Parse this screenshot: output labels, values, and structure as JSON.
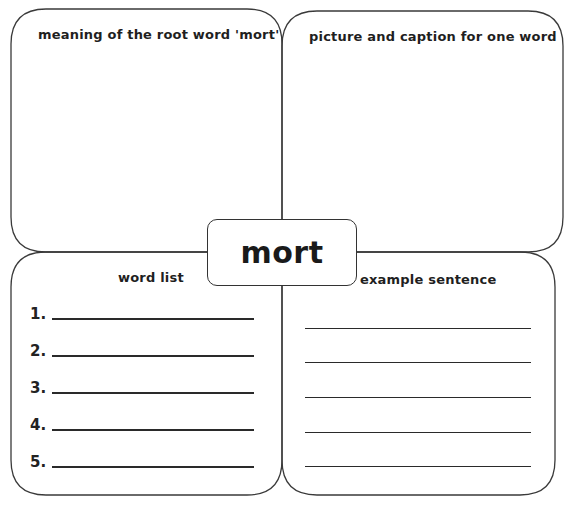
{
  "worksheet": {
    "center_word": "mort",
    "quadrants": {
      "top_left": {
        "heading": "meaning of the root word 'mort'"
      },
      "top_right": {
        "heading": "picture and caption for one word"
      },
      "bottom_left": {
        "heading": "word list",
        "items": [
          {
            "number": "1.",
            "value": ""
          },
          {
            "number": "2.",
            "value": ""
          },
          {
            "number": "3.",
            "value": ""
          },
          {
            "number": "4.",
            "value": ""
          },
          {
            "number": "5.",
            "value": ""
          }
        ]
      },
      "bottom_right": {
        "heading": "example sentence",
        "line_count": 5
      }
    }
  }
}
